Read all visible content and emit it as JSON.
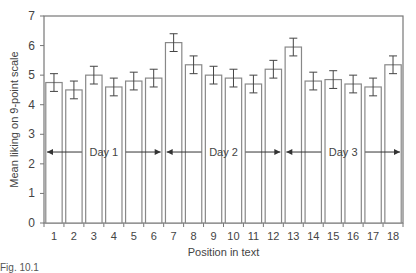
{
  "chart_data": {
    "type": "bar",
    "title": "",
    "xlabel": "Position in text",
    "ylabel": "Mean liking on 9-point scale",
    "ylim": [
      0,
      7
    ],
    "yticks": [
      0,
      1,
      2,
      3,
      4,
      5,
      6,
      7
    ],
    "categories": [
      "1",
      "2",
      "3",
      "4",
      "5",
      "6",
      "7",
      "8",
      "9",
      "10",
      "11",
      "12",
      "13",
      "14",
      "15",
      "16",
      "17",
      "18"
    ],
    "values": [
      4.75,
      4.5,
      5.0,
      4.6,
      4.8,
      4.9,
      6.1,
      5.35,
      5.0,
      4.9,
      4.7,
      5.2,
      5.95,
      4.8,
      4.85,
      4.7,
      4.6,
      5.35
    ],
    "errors": [
      0.3,
      0.3,
      0.3,
      0.3,
      0.3,
      0.3,
      0.3,
      0.3,
      0.3,
      0.3,
      0.3,
      0.3,
      0.3,
      0.3,
      0.3,
      0.3,
      0.3,
      0.3
    ],
    "grid": false,
    "legend": null,
    "annotations": [
      {
        "label": "Day 1",
        "from": 1,
        "to": 6,
        "y": 2.4
      },
      {
        "label": "Day 2",
        "from": 7,
        "to": 12,
        "y": 2.4
      },
      {
        "label": "Day 3",
        "from": 13,
        "to": 18,
        "y": 2.4
      }
    ]
  },
  "caption": "Fig. 10.1"
}
